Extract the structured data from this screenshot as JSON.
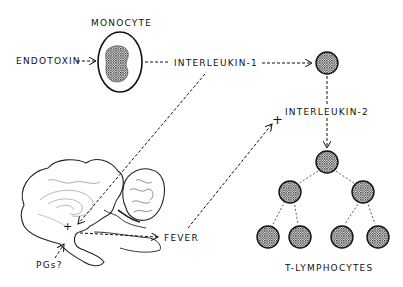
{
  "diagram": {
    "type": "biological pathway",
    "nodes": {
      "endotoxin": "ENDOTOXIN",
      "monocyte": "MONOCYTE",
      "interleukin1": "INTERLEUKIN-1",
      "interleukin2": "INTERLEUKIN-2",
      "fever": "FEVER",
      "pgs": "PGs?",
      "t_lymphocytes": "T-LYMPHOCYTES"
    },
    "plus_sign": "+",
    "edges": [
      {
        "from": "ENDOTOXIN",
        "to": "MONOCYTE",
        "style": "dashed-arrow"
      },
      {
        "from": "MONOCYTE",
        "to": "INTERLEUKIN-1",
        "style": "dashed"
      },
      {
        "from": "INTERLEUKIN-1",
        "to": "T-cell",
        "style": "dashed-arrow"
      },
      {
        "from": "INTERLEUKIN-1",
        "to": "brain (hypothalamus)",
        "style": "dashed-arrow"
      },
      {
        "from": "brain (hypothalamus)",
        "to": "FEVER",
        "style": "dashed-arrow"
      },
      {
        "from": "FEVER",
        "to": "INTERLEUKIN-2 (+)",
        "style": "dashed-arrow"
      },
      {
        "from": "T-cell",
        "to": "INTERLEUKIN-2",
        "style": "dashed"
      },
      {
        "from": "INTERLEUKIN-2",
        "to": "T-LYMPHOCYTES",
        "style": "dashed-arrow"
      },
      {
        "from": "PGs?",
        "to": "brain (hypothalamus)",
        "style": "dashed-arrow"
      }
    ],
    "colors": {
      "ink": "#111111",
      "background": "#ffffff"
    }
  }
}
